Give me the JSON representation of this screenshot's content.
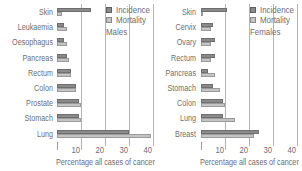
{
  "chart_data": [
    {
      "type": "bar",
      "orientation": "horizontal",
      "title": "Males",
      "xlabel": "Percentage all cases of cancer",
      "ylabel": "",
      "xlim": [
        0,
        40
      ],
      "x_ticks": [
        10,
        20,
        30,
        40
      ],
      "grid": true,
      "legend_position": "upper right",
      "categories": [
        "Skin",
        "Leukaemia",
        "Oesophagus",
        "Pancreas",
        "Rectum",
        "Colon",
        "Prostate",
        "Stomach",
        "Lung"
      ],
      "series": [
        {
          "name": "Incidence",
          "color": "#8a8a8a",
          "values": [
            14,
            3,
            3,
            4,
            6,
            8,
            9,
            9,
            30
          ]
        },
        {
          "name": "Mortality",
          "color": "#c4c4c4",
          "values": [
            2,
            4,
            4,
            5,
            6,
            8,
            10,
            10,
            39
          ]
        }
      ]
    },
    {
      "type": "bar",
      "orientation": "horizontal",
      "title": "Females",
      "xlabel": "Percentage all cases of cancer",
      "ylabel": "",
      "xlim": [
        0,
        40
      ],
      "x_ticks": [
        10,
        20,
        30,
        40
      ],
      "grid": true,
      "legend_position": "upper right",
      "categories": [
        "Skin",
        "Cervix",
        "Ovary",
        "Rectum",
        "Pancreas",
        "Stomach",
        "Colon",
        "Lung",
        "Breast"
      ],
      "series": [
        {
          "name": "Incidence",
          "color": "#8a8a8a",
          "values": [
            11,
            5,
            6,
            6,
            3,
            5,
            9,
            9,
            24
          ]
        },
        {
          "name": "Mortality",
          "color": "#c4c4c4",
          "values": [
            1,
            4,
            4,
            4,
            6,
            8,
            10,
            14,
            22
          ]
        }
      ]
    }
  ],
  "legend": {
    "incidence": "Incidence",
    "mortality": "Mortality"
  },
  "panels": [
    {
      "sex_label": "Males",
      "xlabel": "Percentage all cases of cancer",
      "ticks": [
        "10",
        "20",
        "30",
        "40"
      ]
    },
    {
      "sex_label": "Females",
      "xlabel": "Percentage all cases of cancer",
      "ticks": [
        "10",
        "20",
        "30",
        "40"
      ]
    }
  ]
}
